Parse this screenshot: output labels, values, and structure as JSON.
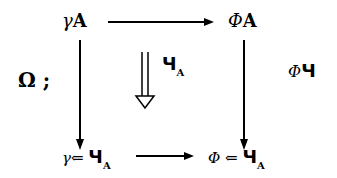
{
  "diagram": {
    "type": "commutative-square",
    "nodes": {
      "top_left": {
        "prefix": "γ",
        "main": "A"
      },
      "top_right": {
        "prefix": "Φ",
        "main": "A"
      },
      "bottom_left": {
        "prefix": "γ",
        "op": "⇐",
        "main": "Ч",
        "sub": "A"
      },
      "bottom_right": {
        "prefix": "Φ",
        "op": "⇐",
        "main": "Ч",
        "sub": "A"
      }
    },
    "labels": {
      "left": "Ω ;",
      "center_main": "Ч",
      "center_sub": "A",
      "right_prefix": "Φ",
      "right_main": "Ч"
    },
    "arrows": [
      {
        "from": "top_left",
        "to": "top_right",
        "style": "single"
      },
      {
        "from": "top_left",
        "to": "bottom_left",
        "style": "single"
      },
      {
        "from": "top_right",
        "to": "bottom_right",
        "style": "single"
      },
      {
        "from": "bottom_left",
        "to": "bottom_right",
        "style": "single"
      },
      {
        "from": "top",
        "to": "bottom",
        "style": "double-hollow",
        "position": "center"
      }
    ]
  }
}
